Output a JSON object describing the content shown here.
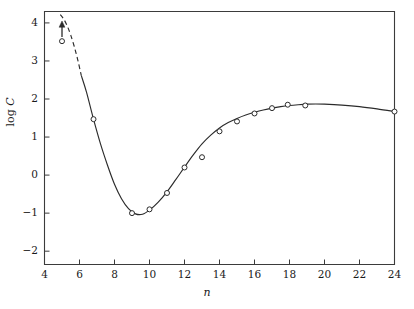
{
  "chart_data": {
    "type": "scatter",
    "title": "",
    "xlabel": "n",
    "ylabel": "log C",
    "xlim": [
      4,
      24
    ],
    "ylim": [
      -2.35,
      4.3
    ],
    "grid": false,
    "legend": null,
    "xticks": [
      4,
      6,
      8,
      10,
      12,
      14,
      16,
      18,
      20,
      22,
      24
    ],
    "yticks": [
      -2,
      -1,
      0,
      1,
      2,
      3,
      4
    ],
    "xtick_labels": [
      "4",
      "6",
      "8",
      "10",
      "12",
      "14",
      "16",
      "18",
      "20",
      "22",
      "24"
    ],
    "ytick_labels": [
      "−2",
      "−1",
      "0",
      "1",
      "2",
      "3",
      "4"
    ],
    "series": [
      {
        "name": "data points",
        "marker": "open-circle",
        "x": [
          5,
          6.8,
          9,
          10,
          11,
          12,
          13,
          14,
          15,
          16,
          17,
          17.9,
          18.9,
          24
        ],
        "y": [
          3.52,
          1.47,
          -1.0,
          -0.9,
          -0.47,
          0.2,
          0.47,
          1.15,
          1.41,
          1.62,
          1.76,
          1.85,
          1.83,
          1.67
        ]
      },
      {
        "name": "fitted curve (solid)",
        "style": "solid",
        "x": [
          6.1,
          6.4,
          6.8,
          7.2,
          7.6,
          8.0,
          8.4,
          8.8,
          9.2,
          9.6,
          10.0,
          10.5,
          11.0,
          11.5,
          12.0,
          12.5,
          13.0,
          13.5,
          14.0,
          14.5,
          15.0,
          15.5,
          16.0,
          16.5,
          17.0,
          17.5,
          18.0,
          18.5,
          19.0,
          19.5,
          20.0,
          21.0,
          22.0,
          23.0,
          24.0
        ],
        "y": [
          2.62,
          2.18,
          1.47,
          0.82,
          0.26,
          -0.24,
          -0.62,
          -0.88,
          -1.02,
          -1.03,
          -0.92,
          -0.71,
          -0.44,
          -0.12,
          0.21,
          0.53,
          0.82,
          1.05,
          1.24,
          1.38,
          1.49,
          1.58,
          1.65,
          1.71,
          1.76,
          1.8,
          1.83,
          1.85,
          1.865,
          1.87,
          1.865,
          1.84,
          1.8,
          1.74,
          1.67
        ]
      },
      {
        "name": "extrapolated curve (dashed)",
        "style": "dashed",
        "x": [
          4.9,
          5.1,
          5.3,
          5.5,
          5.7,
          5.9,
          6.1
        ],
        "y": [
          4.22,
          4.1,
          3.92,
          3.68,
          3.38,
          3.03,
          2.62
        ]
      }
    ],
    "annotations": [
      {
        "type": "up-arrow",
        "x": 5,
        "y_from": 3.52,
        "y_to": 4.05,
        "note": "lower-limit arrow at leftmost point"
      }
    ],
    "colors": {
      "axis": "#3b3b3b",
      "curve": "#2b2b2b",
      "marker_edge": "#2b2b2b",
      "marker_face": "#ffffff",
      "background": "#ffffff",
      "text": "#1a1a1a"
    }
  },
  "labels": {
    "y_axis_prefix": "log ",
    "y_axis_variable": "C",
    "x_axis": "n"
  }
}
